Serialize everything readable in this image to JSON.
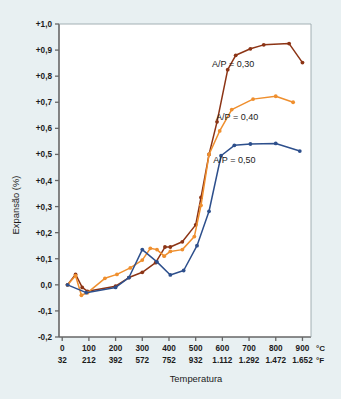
{
  "chart_data": {
    "type": "line",
    "title": "",
    "xlabel": "Temperatura",
    "ylabel": "Expansão (%)",
    "xlim": [
      0,
      900
    ],
    "ylim": [
      -0.2,
      1.0
    ],
    "grid": false,
    "legend_position": "inline-right",
    "x_unit_primary": "°C",
    "x_unit_secondary": "°F",
    "x_ticks_c": [
      "0",
      "100",
      "200",
      "300",
      "400",
      "500",
      "600",
      "700",
      "800",
      "900"
    ],
    "x_ticks_f": [
      "32",
      "212",
      "392",
      "572",
      "752",
      "932",
      "1.112",
      "1.292",
      "1.472",
      "1.652"
    ],
    "y_ticks": [
      "+1,0",
      "+0,9",
      "+0,8",
      "+0,7",
      "+0,6",
      "+0,5",
      "+0,4",
      "+0,3",
      "+0,2",
      "+0,1",
      "0,0",
      "-0,1",
      "-0,2"
    ],
    "series": [
      {
        "name": "A/P = 0,30",
        "color": "#8c3415",
        "label": "A/P = 0,30",
        "label_x": 640,
        "label_y": 0.845,
        "points": [
          [
            20,
            0.0
          ],
          [
            50,
            0.04
          ],
          [
            75,
            -0.01
          ],
          [
            95,
            -0.025
          ],
          [
            200,
            -0.005
          ],
          [
            250,
            0.028
          ],
          [
            300,
            0.048
          ],
          [
            350,
            0.085
          ],
          [
            385,
            0.145
          ],
          [
            405,
            0.145
          ],
          [
            450,
            0.165
          ],
          [
            500,
            0.23
          ],
          [
            520,
            0.335
          ],
          [
            550,
            0.5
          ],
          [
            580,
            0.625
          ],
          [
            620,
            0.825
          ],
          [
            650,
            0.88
          ],
          [
            705,
            0.905
          ],
          [
            755,
            0.92
          ],
          [
            850,
            0.925
          ],
          [
            900,
            0.852
          ]
        ]
      },
      {
        "name": "A/P = 0,40",
        "color": "#ef8f2e",
        "label": "A/P = 0,40",
        "label_x": 655,
        "label_y": 0.645,
        "points": [
          [
            20,
            0.0
          ],
          [
            50,
            0.035
          ],
          [
            72,
            -0.04
          ],
          [
            95,
            -0.03
          ],
          [
            160,
            0.025
          ],
          [
            205,
            0.04
          ],
          [
            255,
            0.065
          ],
          [
            300,
            0.095
          ],
          [
            330,
            0.14
          ],
          [
            355,
            0.135
          ],
          [
            382,
            0.11
          ],
          [
            405,
            0.128
          ],
          [
            450,
            0.135
          ],
          [
            495,
            0.185
          ],
          [
            520,
            0.305
          ],
          [
            550,
            0.5
          ],
          [
            590,
            0.59
          ],
          [
            635,
            0.672
          ],
          [
            715,
            0.712
          ],
          [
            800,
            0.723
          ],
          [
            865,
            0.7
          ]
        ]
      },
      {
        "name": "A/P = 0,50",
        "color": "#2d4f8c",
        "label": "A/P = 0,50",
        "label_x": 645,
        "label_y": 0.478,
        "points": [
          [
            20,
            0.0
          ],
          [
            90,
            -0.03
          ],
          [
            200,
            -0.01
          ],
          [
            250,
            0.028
          ],
          [
            300,
            0.135
          ],
          [
            355,
            0.088
          ],
          [
            405,
            0.038
          ],
          [
            455,
            0.055
          ],
          [
            505,
            0.15
          ],
          [
            550,
            0.282
          ],
          [
            595,
            0.495
          ],
          [
            645,
            0.535
          ],
          [
            705,
            0.54
          ],
          [
            800,
            0.542
          ],
          [
            890,
            0.513
          ]
        ]
      }
    ]
  },
  "axis": {
    "y_title": "Expansão (%)",
    "x_title": "Temperatura",
    "celsius_symbol": "°C",
    "fahrenheit_symbol": "°F"
  },
  "colors": {
    "background": "#e8f0f2",
    "plot_background": "#ffffff",
    "axis": "#5a5a5a",
    "series_brown": "#8c3415",
    "series_orange": "#ef8f2e",
    "series_blue": "#2d4f8c"
  }
}
